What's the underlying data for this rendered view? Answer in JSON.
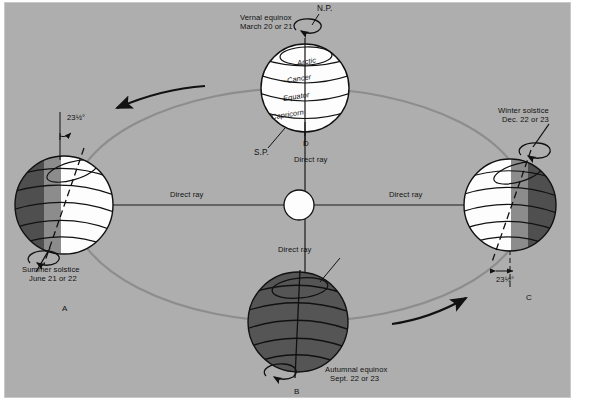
{
  "figure": {
    "background_color": "#aeaeae",
    "frame_color": "#c9c9c9"
  },
  "colors": {
    "lit_hemisphere": "#fdfdfd",
    "twilight_band": "#8c8c8c",
    "dark_hemisphere": "#4f4f4f",
    "night_earth": "#555555",
    "orbit_line": "#8f8f8f",
    "ray_line": "#1a1a1a",
    "sun_fill": "#fdfdfd"
  },
  "sun": {
    "label": "",
    "cx": 299,
    "cy": 205,
    "r": 15
  },
  "rays": [
    {
      "name": "ray-left",
      "label": "Direct ray",
      "x": 170,
      "y": 192
    },
    {
      "name": "ray-right",
      "label": "Direct ray",
      "x": 392,
      "y": 192
    },
    {
      "name": "ray-top",
      "label": "Direct ray",
      "x": 294,
      "y": 157
    },
    {
      "name": "ray-bottom",
      "label": "Direct ray",
      "x": 294,
      "y": 247
    }
  ],
  "positions": [
    {
      "id": "vernal-equinox",
      "name": "top-earth",
      "title": "Vernal equinox",
      "date": "March 20 or 21",
      "letter": "D",
      "pole_north": "N.P.",
      "pole_south": "S.P.",
      "zone_labels": [
        "Arctic",
        "Cancer",
        "Equator",
        "Capricorn"
      ],
      "cx": 305,
      "cy": 88,
      "r": 44
    },
    {
      "id": "summer-solstice",
      "name": "left-earth",
      "title": "Summer solstice",
      "date": "June 21 or 22",
      "letter": "A",
      "tilt_label": "23½°",
      "cx": 64,
      "cy": 205,
      "r": 49
    },
    {
      "id": "winter-solstice",
      "name": "right-earth",
      "title": "Winter solstice",
      "date": "Dec. 22 or 23",
      "letter": "C",
      "tilt_label": "23½°",
      "cx": 510,
      "cy": 205,
      "r": 46
    },
    {
      "id": "autumnal-equinox",
      "name": "bottom-earth",
      "title": "Autumnal equinox",
      "date": "Sept. 22 or 23",
      "letter": "B",
      "cx": 298,
      "cy": 322,
      "r": 50
    }
  ],
  "annotations": {
    "orbit_direction_note": "counterclockwise",
    "arrow_left_name": "orbit-direction-arrow-left",
    "arrow_right_name": "orbit-direction-arrow-right",
    "rotation_arrow_name": "earth-rotation-arrow"
  },
  "text_positions": {
    "vernal_title_x": 240,
    "vernal_title_y": 16,
    "summer_title_x": 22,
    "summer_title_y": 266,
    "winter_title_x": 498,
    "winter_title_y": 108,
    "autumnal_title_x": 325,
    "autumnal_title_y": 367,
    "np_x": 318,
    "np_y": 4,
    "sp_x": 256,
    "sp_y": 151,
    "d_x": 303,
    "d_y": 139,
    "a_x": 63,
    "a_y": 305,
    "b_x": 295,
    "b_y": 388,
    "c_x": 527,
    "c_y": 294,
    "tilt_left_x": 70,
    "tilt_left_y": 113,
    "tilt_right_x": 501,
    "tilt_right_y": 278
  }
}
